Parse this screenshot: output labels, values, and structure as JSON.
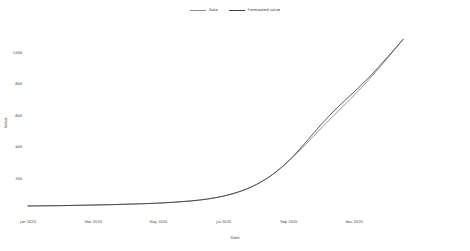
{
  "chart_data": {
    "type": "line",
    "title": "",
    "xlabel": "Date",
    "ylabel": "Value",
    "grid": false,
    "legend_position": "top-center",
    "xlim": [
      "2020-01-01",
      "2020-12-15"
    ],
    "ylim": [
      0,
      1150
    ],
    "yticks": [
      200,
      400,
      600,
      800,
      1000
    ],
    "ytick_labels": [
      "200",
      "400",
      "600",
      "800",
      "1000"
    ],
    "xticks": [
      "2020-01",
      "2020-03",
      "2020-05",
      "2020-07",
      "2020-09",
      "2020-11"
    ],
    "xtick_labels": [
      "Jan 2020",
      "Mar 2020",
      "May 2020",
      "Jul 2020",
      "Sep 2020",
      "Nov 2020"
    ],
    "series": [
      {
        "name": "Data",
        "color": "#8c8c8c",
        "x": [
          "2020-01-01",
          "2020-01-15",
          "2020-02-01",
          "2020-02-15",
          "2020-03-01",
          "2020-03-15",
          "2020-04-01",
          "2020-04-15",
          "2020-05-01",
          "2020-05-15",
          "2020-06-01",
          "2020-06-15",
          "2020-07-01",
          "2020-07-15",
          "2020-08-01",
          "2020-08-15",
          "2020-09-01",
          "2020-09-15",
          "2020-10-01",
          "2020-10-15",
          "2020-11-01",
          "2020-11-15",
          "2020-12-01",
          "2020-12-15"
        ],
        "values": [
          32,
          33,
          34,
          36,
          38,
          40,
          43,
          46,
          50,
          56,
          64,
          76,
          95,
          124,
          168,
          232,
          318,
          420,
          528,
          632,
          735,
          845,
          965,
          1090
        ]
      },
      {
        "name": "Forecasted value",
        "color": "#3f3f3f",
        "x": [
          "2020-01-01",
          "2020-01-15",
          "2020-02-01",
          "2020-02-15",
          "2020-03-01",
          "2020-03-15",
          "2020-04-01",
          "2020-04-15",
          "2020-05-01",
          "2020-05-15",
          "2020-06-01",
          "2020-06-15",
          "2020-07-01",
          "2020-07-15",
          "2020-08-01",
          "2020-08-15",
          "2020-09-01",
          "2020-09-15",
          "2020-10-01",
          "2020-10-15",
          "2020-11-01",
          "2020-11-15",
          "2020-12-01",
          "2020-12-15"
        ],
        "values": [
          32,
          33,
          34,
          36,
          38,
          40,
          43,
          46,
          50,
          56,
          64,
          76,
          95,
          124,
          168,
          232,
          320,
          432,
          552,
          660,
          756,
          858,
          972,
          1090
        ]
      }
    ]
  },
  "legend": {
    "entries": [
      {
        "label": "Data",
        "color": "#8c8c8c"
      },
      {
        "label": "Forecasted value",
        "color": "#3f3f3f"
      }
    ]
  },
  "axes": {
    "y_title": "Value",
    "x_title": "Date"
  },
  "colors": {
    "background": "#ffffff",
    "axis_line": "#4a4a4a",
    "tick_text": "#3a3a3a",
    "data_series": "#8c8c8c",
    "forecast_series": "#3f3f3f"
  }
}
